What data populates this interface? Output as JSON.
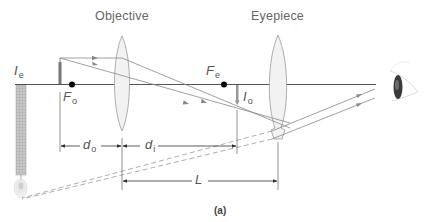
{
  "figure": {
    "caption": "(a)",
    "labels": {
      "objective": "Objective",
      "eyepiece": "Eyepiece"
    },
    "symbols": {
      "Ie": {
        "main": "I",
        "sub": "e"
      },
      "Fo": {
        "main": "F",
        "sub": "o"
      },
      "Fe": {
        "main": "F",
        "sub": "e"
      },
      "Io": {
        "main": "I",
        "sub": "o"
      },
      "do": {
        "main": "d",
        "sub": "o"
      },
      "di": {
        "main": "d",
        "sub": "i"
      },
      "L": {
        "main": "L"
      }
    },
    "colors": {
      "axis": "#555555",
      "ray": "#888888",
      "lens_fill": "#f2f2f2",
      "lens_stroke": "#999999",
      "image_fill": "#bdbdbd",
      "focal_point": "#000000"
    },
    "elements": [
      "optical-axis",
      "object",
      "objective-lens",
      "eyepiece-lens",
      "focal-point-objective",
      "focal-point-eyepiece",
      "intermediate-image",
      "final-virtual-image",
      "eye",
      "dimension-do",
      "dimension-di",
      "dimension-L"
    ]
  }
}
